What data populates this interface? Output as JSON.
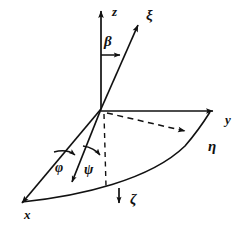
{
  "figure": {
    "kind": "coordinate-axes-diagram",
    "background_color": "#ffffff",
    "stroke_color": "#111111",
    "width": 245,
    "height": 229
  },
  "axes": [
    {
      "id": "z",
      "label": "z",
      "kind": "fixed-axis",
      "style": "solid",
      "arrow": true,
      "label_x": 112,
      "label_y": 5
    },
    {
      "id": "y",
      "label": "y",
      "kind": "fixed-axis",
      "style": "solid",
      "arrow": true,
      "label_x": 225,
      "label_y": 113
    },
    {
      "id": "x",
      "label": "x",
      "kind": "fixed-axis",
      "style": "solid",
      "arrow": true,
      "label_x": 24,
      "label_y": 208
    },
    {
      "id": "xi",
      "label": "ξ",
      "kind": "rotated-axis",
      "style": "solid",
      "arrow": true,
      "label_x": 146,
      "label_y": 8
    },
    {
      "id": "eta",
      "label": "η",
      "kind": "rotated-axis",
      "style": "dashed",
      "arrow": true,
      "label_x": 208,
      "label_y": 139
    },
    {
      "id": "zeta",
      "label": "ζ",
      "kind": "rotated-axis",
      "style": "dashed",
      "arrow": true,
      "label_x": 130,
      "label_y": 192
    }
  ],
  "angles": [
    {
      "id": "beta",
      "label": "β",
      "between": "z-axis and xi-axis",
      "label_x": 104,
      "label_y": 34
    },
    {
      "id": "phi",
      "label": "φ",
      "between": "x-axis and projection line",
      "label_x": 55,
      "label_y": 161
    },
    {
      "id": "psi",
      "label": "ψ",
      "between": "projection line and zeta line",
      "label_x": 84,
      "label_y": 163
    }
  ],
  "curves": [
    {
      "id": "main-arc",
      "kind": "solid-arc",
      "description": "solid sweeping arc from lower left through bottom to the y axis tip"
    },
    {
      "id": "eta-dashed-ray",
      "kind": "dashed-ray",
      "description": "dashed ray from origin toward the arc on the right"
    },
    {
      "id": "zeta-dashed-drop",
      "kind": "dashed-ray",
      "description": "vertical dashed drop line from origin toward zeta"
    }
  ],
  "origin": {
    "label": "origin",
    "x": 101,
    "y": 109
  }
}
